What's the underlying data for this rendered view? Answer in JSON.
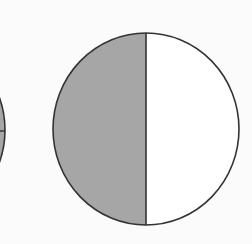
{
  "diagram": {
    "colors": {
      "background": "#fbfbfb",
      "shaded": "#a6a6a6",
      "unshaded": "#ffffff",
      "outline": "#333333"
    },
    "main_circle": {
      "parts": 2,
      "shaded_parts": 1,
      "fraction_shaded": "1/2",
      "divider": "vertical"
    },
    "partial_circle": {
      "visible": "right edge only",
      "divider": "horizontal"
    }
  }
}
